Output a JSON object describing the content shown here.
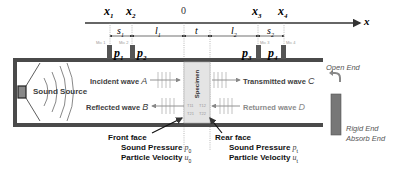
{
  "axis": {
    "points": [
      {
        "id": "x1",
        "label": "x",
        "sub": "1",
        "x": 110
      },
      {
        "id": "x2",
        "label": "x",
        "sub": "2",
        "x": 132
      },
      {
        "id": "origin",
        "label": "0",
        "sub": "",
        "x": 184
      },
      {
        "id": "x3",
        "label": "x",
        "sub": "3",
        "x": 258
      },
      {
        "id": "x4",
        "label": "x",
        "sub": "4",
        "x": 284
      }
    ],
    "axis_label": "x",
    "segments": [
      {
        "label": "s",
        "sub": "1"
      },
      {
        "label": "l",
        "sub": "1"
      },
      {
        "label": "t",
        "sub": ""
      },
      {
        "label": "l",
        "sub": "2"
      },
      {
        "label": "s",
        "sub": "2"
      }
    ]
  },
  "mics": [
    {
      "name": "Mic 1",
      "pressure": "p",
      "sub": "1"
    },
    {
      "name": "Mic 2",
      "pressure": "p",
      "sub": "2"
    },
    {
      "name": "Mic 3",
      "pressure": "p",
      "sub": "3"
    },
    {
      "name": "Mic 4",
      "pressure": "p",
      "sub": "4"
    }
  ],
  "tube": {
    "source_label": "Sound Source",
    "specimen_label": "Specimen",
    "matrix_labels": [
      "T11",
      "T12",
      "T21",
      "T22"
    ]
  },
  "waves": {
    "incident": {
      "text": "Incident wave",
      "var": "A"
    },
    "reflected": {
      "text": "Reflected wave",
      "var": "B"
    },
    "transmitted": {
      "text": "Transmitted wave",
      "var": "C"
    },
    "returned": {
      "text": "Returned wave",
      "var": "D"
    }
  },
  "front": {
    "title": "Front face",
    "pressure_label": "Sound Pressure",
    "pressure_var": "p",
    "pressure_sub": "0",
    "velocity_label": "Particle Velocity",
    "velocity_var": "u",
    "velocity_sub": "0"
  },
  "rear": {
    "title": "Rear face",
    "pressure_label": "Sound Pressure",
    "pressure_var": "p",
    "pressure_sub": "t",
    "velocity_label": "Particle Velocity",
    "velocity_var": "u",
    "velocity_sub": "t"
  },
  "ends": {
    "open": "Open End",
    "rigid": "Rigid End",
    "absorb": "Absorb End"
  },
  "colors": {
    "wall": "#4a4a4a",
    "specimen": "#e4e4e4",
    "text": "#404040",
    "faint": "#8a8a8a"
  }
}
